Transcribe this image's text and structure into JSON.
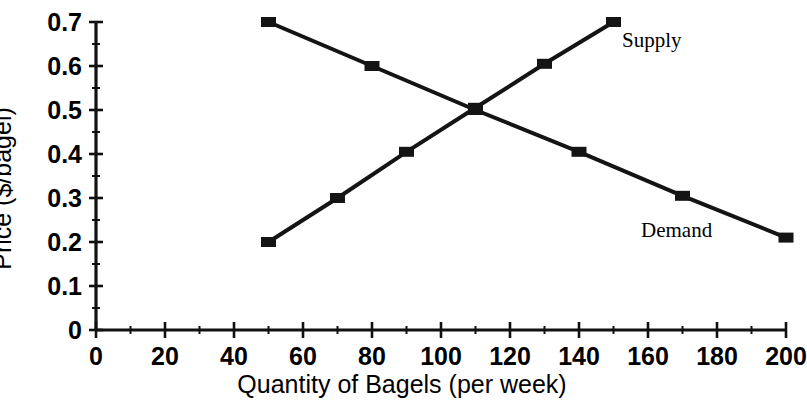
{
  "chart_data": {
    "type": "line",
    "title": "",
    "xlabel": "Quantity of Bagels (per week)",
    "ylabel": "Price ($/bagel)",
    "xlim": [
      0,
      200
    ],
    "ylim": [
      0,
      0.7
    ],
    "grid": false,
    "legend_position": "inline-annotation",
    "x_ticks": [
      {
        "value": 0,
        "label": "0"
      },
      {
        "value": 20,
        "label": "20"
      },
      {
        "value": 40,
        "label": "40"
      },
      {
        "value": 60,
        "label": "60"
      },
      {
        "value": 80,
        "label": "80"
      },
      {
        "value": 100,
        "label": "100"
      },
      {
        "value": 120,
        "label": "120"
      },
      {
        "value": 140,
        "label": "140"
      },
      {
        "value": 160,
        "label": "160"
      },
      {
        "value": 180,
        "label": "180"
      },
      {
        "value": 200,
        "label": "200"
      }
    ],
    "x_minor_ticks": [
      10,
      30,
      50,
      70,
      90,
      110,
      130,
      150,
      170,
      190
    ],
    "y_ticks": [
      {
        "value": 0,
        "label": "0"
      },
      {
        "value": 0.1,
        "label": "0.1"
      },
      {
        "value": 0.2,
        "label": "0.2"
      },
      {
        "value": 0.3,
        "label": "0.3"
      },
      {
        "value": 0.4,
        "label": "0.4"
      },
      {
        "value": 0.5,
        "label": "0.5"
      },
      {
        "value": 0.6,
        "label": "0.6"
      },
      {
        "value": 0.7,
        "label": "0.7"
      }
    ],
    "y_minor_ticks": [
      0.05,
      0.15,
      0.25,
      0.35,
      0.45,
      0.55,
      0.65
    ],
    "marker": "square",
    "series": [
      {
        "name": "Supply",
        "label": "Supply",
        "color": "#141414",
        "points": [
          {
            "x": 50,
            "y": 0.2
          },
          {
            "x": 70,
            "y": 0.3
          },
          {
            "x": 90,
            "y": 0.405
          },
          {
            "x": 110,
            "y": 0.505
          },
          {
            "x": 130,
            "y": 0.605
          },
          {
            "x": 150,
            "y": 0.7
          }
        ]
      },
      {
        "name": "Demand",
        "label": "Demand",
        "color": "#141414",
        "points": [
          {
            "x": 50,
            "y": 0.7
          },
          {
            "x": 80,
            "y": 0.6
          },
          {
            "x": 110,
            "y": 0.5
          },
          {
            "x": 140,
            "y": 0.405
          },
          {
            "x": 170,
            "y": 0.305
          },
          {
            "x": 200,
            "y": 0.21
          }
        ]
      }
    ]
  }
}
